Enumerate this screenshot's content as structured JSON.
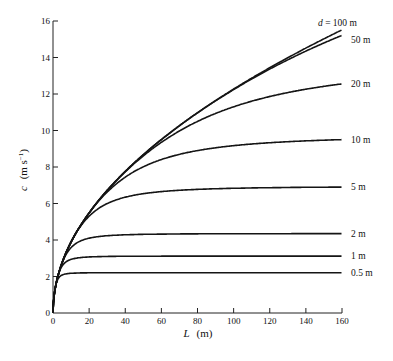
{
  "chart_data": {
    "type": "line",
    "title": "",
    "xlabel": "L (m)",
    "ylabel": "c (m s⁻¹)",
    "xlim": [
      0,
      160
    ],
    "ylim": [
      0,
      16
    ],
    "xticks": [
      0,
      20,
      40,
      60,
      80,
      100,
      120,
      140,
      160
    ],
    "yticks": [
      0,
      2,
      4,
      6,
      8,
      10,
      12,
      14,
      16
    ],
    "grid": false,
    "legend_position": "inline labels at right end of each curve",
    "x": [
      0,
      1,
      2,
      5,
      10,
      15,
      20,
      30,
      40,
      60,
      80,
      100,
      120,
      140,
      160
    ],
    "series": [
      {
        "name": "d = 100 m",
        "label": "d = 100 m",
        "values": [
          0,
          1.25,
          1.77,
          2.79,
          3.95,
          4.84,
          5.59,
          6.84,
          7.9,
          9.68,
          11.17,
          12.49,
          13.68,
          14.77,
          15.5
        ]
      },
      {
        "name": "50 m",
        "label": "50 m",
        "values": [
          0,
          1.25,
          1.77,
          2.79,
          3.95,
          4.84,
          5.59,
          6.84,
          7.9,
          9.67,
          11.12,
          12.37,
          13.45,
          14.4,
          15.2
        ]
      },
      {
        "name": "20 m",
        "label": "20 m",
        "values": [
          0,
          1.25,
          1.77,
          2.79,
          3.95,
          4.84,
          5.58,
          6.78,
          7.72,
          9.09,
          10.07,
          10.83,
          11.45,
          11.97,
          12.55
        ]
      },
      {
        "name": "10 m",
        "label": "10 m",
        "values": [
          0,
          1.25,
          1.77,
          2.79,
          3.94,
          4.76,
          5.38,
          6.29,
          6.95,
          7.84,
          8.42,
          8.81,
          9.1,
          9.31,
          9.5
        ]
      },
      {
        "name": "5 m",
        "label": "5 m",
        "values": [
          0,
          1.25,
          1.77,
          2.79,
          3.82,
          4.43,
          4.85,
          5.42,
          5.84,
          6.35,
          6.6,
          6.74,
          6.82,
          6.87,
          6.9
        ]
      },
      {
        "name": "2 m",
        "label": "2 m",
        "values": [
          0,
          1.25,
          1.77,
          2.68,
          3.3,
          3.66,
          3.87,
          4.09,
          4.19,
          4.28,
          4.31,
          4.33,
          4.34,
          4.35,
          4.35
        ]
      },
      {
        "name": "1 m",
        "label": "1 m",
        "values": [
          0,
          1.25,
          1.75,
          2.45,
          2.82,
          2.95,
          3.01,
          3.06,
          3.08,
          3.1,
          3.11,
          3.11,
          3.12,
          3.12,
          3.12
        ]
      },
      {
        "name": "0.5 m",
        "label": "0.5 m",
        "values": [
          0,
          1.24,
          1.69,
          2.09,
          2.18,
          2.2,
          2.2,
          2.21,
          2.21,
          2.21,
          2.21,
          2.21,
          2.21,
          2.21,
          2.21
        ]
      }
    ],
    "annotations": [
      "d = 100 m",
      "50 m",
      "20 m",
      "10 m",
      "5 m",
      "2 m",
      "1 m",
      "0.5 m"
    ]
  },
  "axes": {
    "x_title_var": "L",
    "x_title_unit": "(m)",
    "y_title_var": "c",
    "y_title_unit": "(m s",
    "y_title_sup": "−1",
    "y_title_close": ")"
  },
  "style": {
    "line_color": "#151515",
    "axis_color": "#222222",
    "background": "#ffffff"
  }
}
